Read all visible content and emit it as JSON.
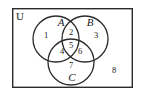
{
  "figure": {
    "type": "venn-diagram",
    "sets_count": 3,
    "universe": {
      "label": "U",
      "label_x": 20,
      "label_y": 17,
      "rect": {
        "x": 12,
        "y": 8,
        "width": 121,
        "height": 80
      }
    },
    "stroke_color": "#2b2b2b",
    "background_color": "#ffffff",
    "text_color": "#1a1a1a",
    "circles": [
      {
        "name": "A",
        "label": "A",
        "cx": 56,
        "cy": 39,
        "r": 23,
        "label_x": 61,
        "label_y": 23
      },
      {
        "name": "B",
        "label": "B",
        "cx": 85,
        "cy": 39,
        "r": 23,
        "label_x": 90,
        "label_y": 23
      },
      {
        "name": "C",
        "label": "C",
        "cx": 71,
        "cy": 62,
        "r": 23,
        "label_x": 72,
        "label_y": 78
      }
    ],
    "regions": [
      {
        "id": "region-1",
        "label": "1",
        "meaning": "A only",
        "x": 46,
        "y": 36
      },
      {
        "id": "region-2",
        "label": "2",
        "meaning": "A and B only",
        "x": 71,
        "y": 33
      },
      {
        "id": "region-3",
        "label": "3",
        "meaning": "B only",
        "x": 96,
        "y": 36
      },
      {
        "id": "region-4",
        "label": "4",
        "meaning": "A and C only",
        "x": 62,
        "y": 52
      },
      {
        "id": "region-5",
        "label": "5",
        "meaning": "A and B and C",
        "x": 71,
        "y": 46
      },
      {
        "id": "region-6",
        "label": "6",
        "meaning": "B and C only",
        "x": 80,
        "y": 52
      },
      {
        "id": "region-7",
        "label": "7",
        "meaning": "C only",
        "x": 71,
        "y": 66
      },
      {
        "id": "region-8",
        "label": "8",
        "meaning": "outside all sets",
        "x": 114,
        "y": 71
      }
    ]
  }
}
